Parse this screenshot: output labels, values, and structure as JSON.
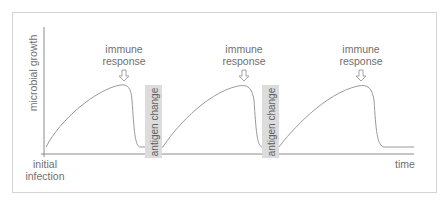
{
  "diagram": {
    "y_axis_label": "microbial growth",
    "x_axis_label": "time",
    "origin_label_line1": "initial",
    "origin_label_line2": "infection",
    "immune_responses": [
      {
        "line1": "immune",
        "line2": "response"
      },
      {
        "line1": "immune",
        "line2": "response"
      },
      {
        "line1": "immune",
        "line2": "response"
      }
    ],
    "antigen_changes": [
      {
        "label": "antigen change"
      },
      {
        "label": "antigen change"
      }
    ],
    "colors": {
      "line": "#9a9a9a",
      "axis": "#8a8a8a",
      "text": "#707070",
      "antigen_box": "#dcdcdc",
      "frame": "#d4d4d4"
    }
  }
}
